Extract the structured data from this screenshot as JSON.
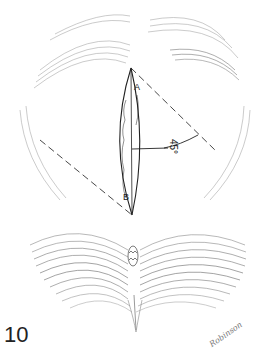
{
  "figure": {
    "number": "10",
    "signature": "Robinson",
    "labels": {
      "point_a": "A",
      "point_b": "B",
      "angle": "45°"
    }
  },
  "colors": {
    "ink": "#222222",
    "hatch": "#9a9a9a",
    "background": "#ffffff"
  }
}
